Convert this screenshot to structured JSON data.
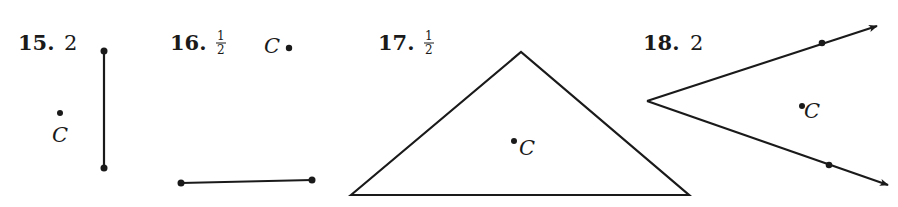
{
  "problems": [
    {
      "number": "15.",
      "scale": "2",
      "figure": "vertical segment",
      "center_label": "C"
    },
    {
      "number": "16.",
      "scale_num": "1",
      "scale_den": "2",
      "figure": "horizontal segment",
      "center_label": "C"
    },
    {
      "number": "17.",
      "scale_num": "1",
      "scale_den": "2",
      "figure": "triangle",
      "center_label": "C"
    },
    {
      "number": "18.",
      "scale": "2",
      "figure": "angle with rays",
      "center_label": "C"
    }
  ],
  "colors": {
    "ink": "#1a1a1a",
    "background": "#ffffff"
  }
}
